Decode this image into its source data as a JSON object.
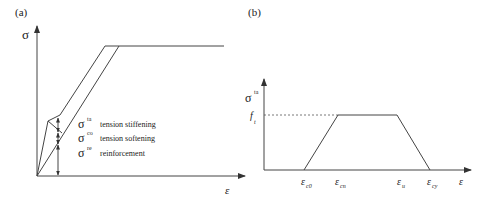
{
  "panel_a": {
    "label": "(a)",
    "y_axis_label": "σ",
    "x_axis_label": "ε",
    "legend": [
      {
        "symbol": "σ",
        "sup": "ta",
        "text": "tension stiffening"
      },
      {
        "symbol": "σ",
        "sup": "co",
        "text": "tension softening"
      },
      {
        "symbol": "σ",
        "sup": "re",
        "text": "reinforcement"
      }
    ]
  },
  "panel_b": {
    "label": "(b)",
    "y_axis_label": "σ",
    "y_axis_sup": "ta",
    "y_level_label": "f",
    "y_level_sub": "t",
    "x_axis_label": "ε",
    "x_ticks": [
      {
        "symbol": "ε",
        "sub": "c0"
      },
      {
        "symbol": "ε",
        "sub": "cn"
      },
      {
        "symbol": "ε",
        "sub": "u"
      },
      {
        "symbol": "ε",
        "sub": "cy"
      }
    ]
  },
  "colors": {
    "line": "#444444",
    "text": "#222222",
    "background": "#ffffff"
  }
}
